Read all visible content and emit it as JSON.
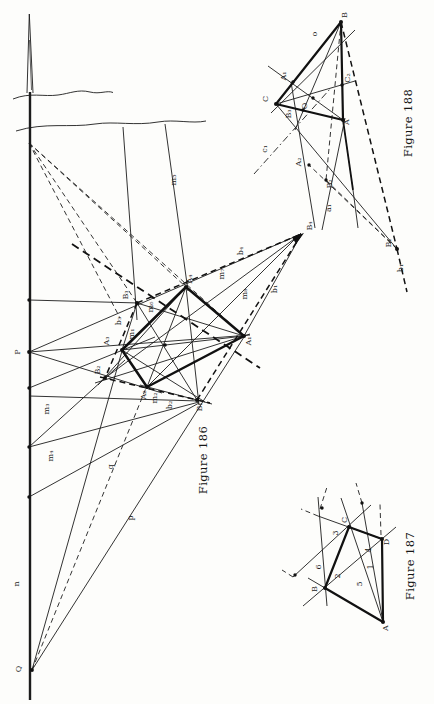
{
  "page": {
    "background": "#fdfdfb",
    "ink": "#1c1c1c"
  },
  "figures": {
    "fig186": {
      "caption": "Figure 186",
      "labels": [
        {
          "name": "label-p-point",
          "text": "P",
          "x": 20,
          "y": 352
        },
        {
          "name": "label-n-line",
          "text": "n",
          "x": 19,
          "y": 584
        },
        {
          "name": "label-q-point",
          "text": "Q",
          "x": 21,
          "y": 669
        },
        {
          "name": "label-q-line",
          "text": "q",
          "x": 113,
          "y": 467
        },
        {
          "name": "label-p-line",
          "text": "p",
          "x": 133,
          "y": 518
        },
        {
          "name": "label-m3-line",
          "text": "m₃",
          "x": 49,
          "y": 409
        },
        {
          "name": "label-m4-line",
          "text": "m₄",
          "x": 53,
          "y": 456
        },
        {
          "name": "label-m5-line",
          "text": "m₅",
          "x": 176,
          "y": 180
        },
        {
          "name": "label-m7-line",
          "text": "m₇",
          "x": 224,
          "y": 274
        },
        {
          "name": "label-m8-line",
          "text": "m₈",
          "x": 247,
          "y": 294
        },
        {
          "name": "label-b4-line",
          "text": "b₄",
          "x": 243,
          "y": 251
        },
        {
          "name": "label-b1-line",
          "text": "b₁",
          "x": 277,
          "y": 289
        },
        {
          "name": "label-B4-point",
          "text": "B₄",
          "x": 312,
          "y": 226
        },
        {
          "name": "label-A4-point",
          "text": "A₄",
          "x": 192,
          "y": 279
        },
        {
          "name": "label-B3-point",
          "text": "B₃",
          "x": 128,
          "y": 295
        },
        {
          "name": "label-m6-line",
          "text": "m₆",
          "x": 153,
          "y": 307
        },
        {
          "name": "label-b3-line",
          "text": "b₃",
          "x": 121,
          "y": 321
        },
        {
          "name": "label-m1-line",
          "text": "m₁",
          "x": 134,
          "y": 334
        },
        {
          "name": "label-A3-point",
          "text": "A₃",
          "x": 109,
          "y": 341
        },
        {
          "name": "label-B2-point",
          "text": "B₂",
          "x": 100,
          "y": 370
        },
        {
          "name": "label-A2-point",
          "text": "A₂",
          "x": 146,
          "y": 395
        },
        {
          "name": "label-m2-line",
          "text": "m₂",
          "x": 157,
          "y": 398
        },
        {
          "name": "label-b2-line",
          "text": "b₂",
          "x": 172,
          "y": 405
        },
        {
          "name": "label-B1-point",
          "text": "B₁",
          "x": 202,
          "y": 407
        },
        {
          "name": "label-A1-point",
          "text": "A₁",
          "x": 251,
          "y": 341
        }
      ]
    },
    "fig187": {
      "caption": "Figure 187",
      "labels": [
        {
          "name": "label-A-vertex",
          "text": "A",
          "x": 388,
          "y": 628
        },
        {
          "name": "label-B-vertex",
          "text": "B",
          "x": 317,
          "y": 589
        },
        {
          "name": "label-C-vertex",
          "text": "C",
          "x": 347,
          "y": 520
        },
        {
          "name": "label-D-vertex",
          "text": "D",
          "x": 389,
          "y": 542
        },
        {
          "name": "label-line-3",
          "text": "3",
          "x": 338,
          "y": 533
        },
        {
          "name": "label-line-6",
          "text": "6",
          "x": 321,
          "y": 567
        },
        {
          "name": "label-line-2",
          "text": "2",
          "x": 340,
          "y": 576
        },
        {
          "name": "label-line-5",
          "text": "5",
          "x": 362,
          "y": 584
        },
        {
          "name": "label-line-4",
          "text": "4",
          "x": 371,
          "y": 550
        },
        {
          "name": "label-line-1",
          "text": "1",
          "x": 373,
          "y": 567
        }
      ]
    },
    "fig188": {
      "caption": "Figure 188",
      "labels": [
        {
          "name": "label-B-vertex",
          "text": "B",
          "x": 347,
          "y": 15
        },
        {
          "name": "label-o-line",
          "text": "o",
          "x": 317,
          "y": 34
        },
        {
          "name": "label-A1-point",
          "text": "A₁",
          "x": 286,
          "y": 76
        },
        {
          "name": "label-C2-point",
          "text": "C₂",
          "x": 350,
          "y": 78
        },
        {
          "name": "label-C-vertex",
          "text": "C",
          "x": 268,
          "y": 99
        },
        {
          "name": "label-B3-point",
          "text": "B₃",
          "x": 291,
          "y": 114
        },
        {
          "name": "label-O-point",
          "text": "O",
          "x": 307,
          "y": 106
        },
        {
          "name": "label-A-vertex",
          "text": "A",
          "x": 349,
          "y": 122
        },
        {
          "name": "label-c1-line",
          "text": "c₁",
          "x": 267,
          "y": 149
        },
        {
          "name": "label-A2-point",
          "text": "A₂",
          "x": 301,
          "y": 162
        },
        {
          "name": "label-B2-point",
          "text": "B₂",
          "x": 332,
          "y": 184
        },
        {
          "name": "label-a1-line",
          "text": "a₁",
          "x": 331,
          "y": 208
        },
        {
          "name": "label-B1-point",
          "text": "B₁",
          "x": 391,
          "y": 243
        },
        {
          "name": "label-b1-line",
          "text": "b₁",
          "x": 403,
          "y": 268
        }
      ]
    }
  }
}
